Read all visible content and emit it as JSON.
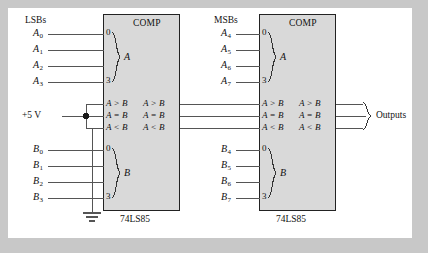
{
  "figure": {
    "background_color": "#c8c8c8",
    "panel_color": "#ffffff",
    "chip_fill_color": "#d8d8d8",
    "wire_color": "#555555",
    "text_color": "#111111"
  },
  "groups": {
    "lsb_label": "LSBs",
    "msb_label": "MSBs",
    "outputs_label": "Outputs"
  },
  "supply": {
    "label": "+5 V"
  },
  "lsb_chip": {
    "title": "COMP",
    "name": "74LS85",
    "a_inputs": [
      {
        "base": "A",
        "sub": "0"
      },
      {
        "base": "A",
        "sub": "1"
      },
      {
        "base": "A",
        "sub": "2"
      },
      {
        "base": "A",
        "sub": "3"
      }
    ],
    "b_inputs": [
      {
        "base": "B",
        "sub": "0"
      },
      {
        "base": "B",
        "sub": "1"
      },
      {
        "base": "B",
        "sub": "2"
      },
      {
        "base": "B",
        "sub": "3"
      }
    ],
    "a_group_label": "A",
    "b_group_label": "B",
    "a_pin_top": "0",
    "a_pin_bottom": "3",
    "b_pin_top": "0",
    "b_pin_bottom": "3",
    "cascade_inputs": [
      "A > B",
      "A = B",
      "A < B"
    ],
    "cascade_outputs": [
      "A > B",
      "A = B",
      "A < B"
    ]
  },
  "msb_chip": {
    "title": "COMP",
    "name": "74LS85",
    "a_inputs": [
      {
        "base": "A",
        "sub": "4"
      },
      {
        "base": "A",
        "sub": "5"
      },
      {
        "base": "A",
        "sub": "6"
      },
      {
        "base": "A",
        "sub": "7"
      }
    ],
    "b_inputs": [
      {
        "base": "B",
        "sub": "4"
      },
      {
        "base": "B",
        "sub": "5"
      },
      {
        "base": "B",
        "sub": "6"
      },
      {
        "base": "B",
        "sub": "7"
      }
    ],
    "a_group_label": "A",
    "b_group_label": "B",
    "a_pin_top": "0",
    "a_pin_bottom": "3",
    "b_pin_top": "0",
    "b_pin_bottom": "3",
    "cascade_inputs": [
      "A > B",
      "A = B",
      "A < B"
    ],
    "cascade_outputs": [
      "A > B",
      "A = B",
      "A < B"
    ]
  }
}
